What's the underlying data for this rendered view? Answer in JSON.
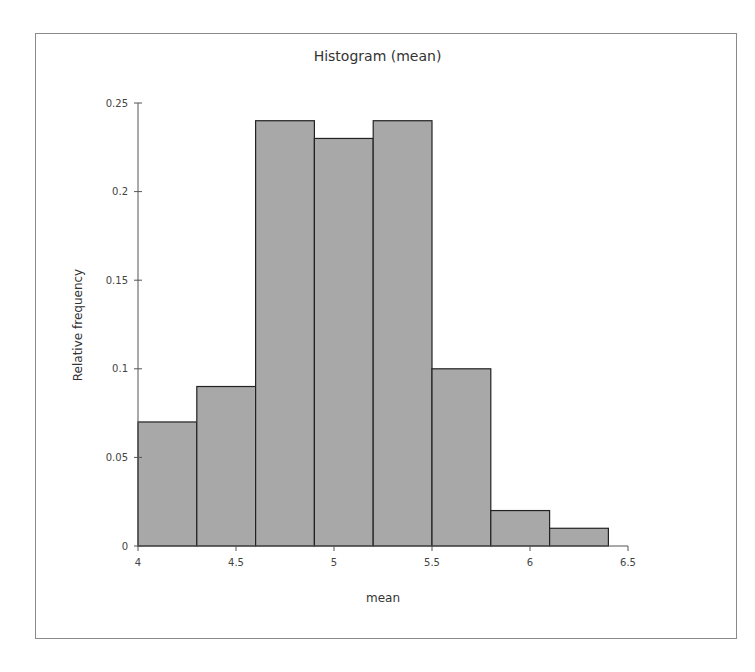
{
  "chart_data": {
    "type": "bar",
    "subtype": "histogram",
    "title": "Histogram (mean)",
    "xlabel": "mean",
    "ylabel": "Relative frequency",
    "bins": [
      {
        "start": 4.0,
        "end": 4.3,
        "value": 0.07
      },
      {
        "start": 4.3,
        "end": 4.6,
        "value": 0.09
      },
      {
        "start": 4.6,
        "end": 4.9,
        "value": 0.24
      },
      {
        "start": 4.9,
        "end": 5.2,
        "value": 0.23
      },
      {
        "start": 5.2,
        "end": 5.5,
        "value": 0.24
      },
      {
        "start": 5.5,
        "end": 5.8,
        "value": 0.1
      },
      {
        "start": 5.8,
        "end": 6.1,
        "value": 0.02
      },
      {
        "start": 6.1,
        "end": 6.4,
        "value": 0.01
      }
    ],
    "categories": [
      "4-4.3",
      "4.3-4.6",
      "4.6-4.9",
      "4.9-5.2",
      "5.2-5.5",
      "5.5-5.8",
      "5.8-6.1",
      "6.1-6.4"
    ],
    "values": [
      0.07,
      0.09,
      0.24,
      0.23,
      0.24,
      0.1,
      0.02,
      0.01
    ],
    "xlim": [
      4,
      6.5
    ],
    "ylim": [
      0,
      0.25
    ],
    "x_ticks": [
      "4",
      "4.5",
      "5",
      "5.5",
      "6",
      "6.5"
    ],
    "y_ticks": [
      "0",
      "0.05",
      "0.1",
      "0.15",
      "0.2",
      "0.25"
    ],
    "grid": false,
    "legend": null,
    "bar_color": "#a8a8a8",
    "bar_edge_color": "#222222"
  }
}
